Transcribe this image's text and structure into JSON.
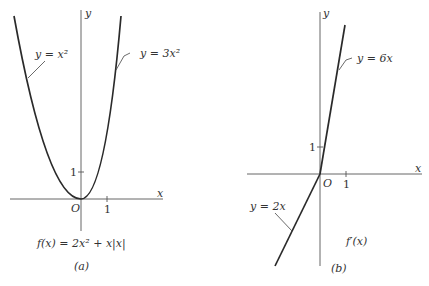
{
  "panels": [
    {
      "id": "a",
      "caption": "(a)",
      "formula": "f(x) = 2x² + x|x|",
      "axis_x_label": "x",
      "axis_y_label": "y",
      "origin_label": "O",
      "tick_x": "1",
      "tick_y": "1",
      "curves": [
        {
          "label": "y = x²",
          "expr": "x^2",
          "domain": "x<0"
        },
        {
          "label": "y = 3x²",
          "expr": "3x^2",
          "domain": "x>=0"
        }
      ]
    },
    {
      "id": "b",
      "caption": "(b)",
      "formula": "f′(x)",
      "axis_x_label": "x",
      "axis_y_label": "y",
      "origin_label": "O",
      "tick_x": "1",
      "tick_y": "1",
      "curves": [
        {
          "label": "y = 6x",
          "expr": "6x",
          "domain": "x>=0"
        },
        {
          "label": "y = 2x",
          "expr": "2x",
          "domain": "x<0"
        }
      ]
    }
  ],
  "colors": {
    "curve": "#2a2a2a",
    "axis": "#555555",
    "background": "#ffffff"
  }
}
